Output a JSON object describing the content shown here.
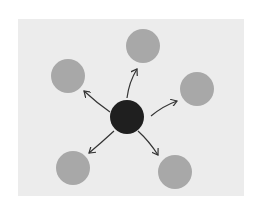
{
  "diagram": {
    "type": "hub-and-spoke",
    "colors": {
      "background": "#ffffff",
      "panel": "#ececec",
      "outer_node": "#a8a8a8",
      "center_node": "#1f1f1f",
      "arrow": "#333333"
    },
    "panel": {
      "x": 18,
      "y": 19,
      "width": 226,
      "height": 177
    },
    "center": {
      "id": "hub",
      "cx": 127,
      "cy": 117,
      "r": 17
    },
    "nodes": [
      {
        "id": "top",
        "cx": 143,
        "cy": 46,
        "r": 17
      },
      {
        "id": "upper-left",
        "cx": 68,
        "cy": 76,
        "r": 17
      },
      {
        "id": "right",
        "cx": 197,
        "cy": 89,
        "r": 17
      },
      {
        "id": "lower-left",
        "cx": 73,
        "cy": 168,
        "r": 17
      },
      {
        "id": "lower-right",
        "cx": 175,
        "cy": 172,
        "r": 17
      }
    ],
    "arrows": [
      {
        "to": "top",
        "x1": 127,
        "y1": 98,
        "qx": 129,
        "qy": 82,
        "x2": 137,
        "y2": 69
      },
      {
        "to": "upper-left",
        "x1": 110,
        "y1": 112,
        "qx": 97,
        "qy": 103,
        "x2": 84,
        "y2": 91
      },
      {
        "to": "right",
        "x1": 151,
        "y1": 116,
        "qx": 163,
        "qy": 106,
        "x2": 177,
        "y2": 101
      },
      {
        "to": "lower-left",
        "x1": 114,
        "y1": 131,
        "qx": 101,
        "qy": 143,
        "x2": 89,
        "y2": 153
      },
      {
        "to": "lower-right",
        "x1": 138,
        "y1": 131,
        "qx": 149,
        "qy": 141,
        "x2": 158,
        "y2": 155
      }
    ]
  }
}
